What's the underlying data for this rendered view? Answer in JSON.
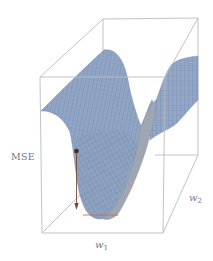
{
  "figure": {
    "axes": {
      "vertical_label": "MSE",
      "x_label_base": "w",
      "x_label_sub": "1",
      "y_label_base": "w",
      "y_label_sub": "2"
    },
    "colors": {
      "box_edge": "#b9bcc4",
      "surface_fill": "#8fa3c3",
      "surface_mesh": "#6c82a6",
      "surface_shadow": "#9aa3ae",
      "arrow": "#7a4a3a",
      "point": "#4a2a22",
      "minimum_line": "#c0705a",
      "label_text": "#6f7888"
    },
    "elements": {
      "start_point": "current weight position on surface",
      "arrow": "gradient descent direction (downward)",
      "minimum_marker": "horizontal line at surface minimum"
    }
  }
}
